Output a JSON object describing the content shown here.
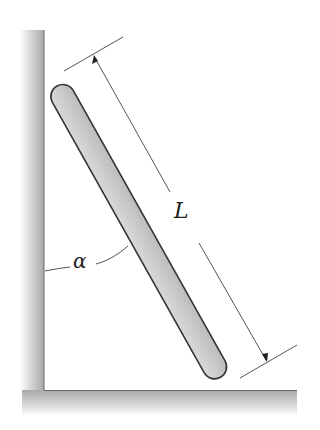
{
  "diagram": {
    "type": "ladder-against-wall",
    "labels": {
      "length": "L",
      "angle": "α"
    },
    "colors": {
      "bar_fill": "#c8c8c8",
      "bar_stroke": "#333333",
      "ground_shade": "#b9b9b9",
      "dimension_line": "#555555"
    }
  }
}
